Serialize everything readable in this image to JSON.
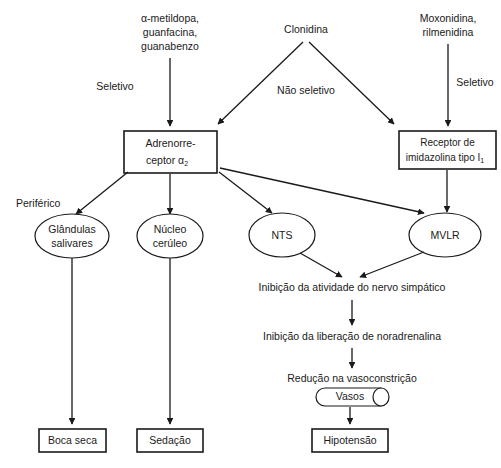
{
  "diagram": {
    "colors": {
      "background": "#ffffff",
      "stroke": "#1a1a1a",
      "text": "#1a1a1a"
    },
    "drug_groups": [
      {
        "id": "alpha-methyldopa-group",
        "lines": [
          "α-metildopa,",
          "guanfacina,",
          "guanabenzo"
        ],
        "pathway_label": "Seletivo"
      },
      {
        "id": "clonidine-group",
        "lines": [
          "Clonidina"
        ],
        "pathway_label": "Não seletivo"
      },
      {
        "id": "moxonidine-group",
        "lines": [
          "Moxonidina,",
          "rilmenidina"
        ],
        "pathway_label": "Seletivo"
      }
    ],
    "receptors": [
      {
        "id": "alpha2-adrenoceptor",
        "line1": "Adrenorre-",
        "line2_main": "ceptor α",
        "line2_sub": "2"
      },
      {
        "id": "imidazoline-receptor",
        "line1": "Receptor de",
        "line2_main": "imidazolina tipo I",
        "line2_sub": "1"
      }
    ],
    "effectors": [
      {
        "id": "salivary-glands",
        "line1": "Glândulas",
        "line2": "salivares"
      },
      {
        "id": "locus-coeruleus",
        "line1": "Núcleo",
        "line2": "cerúleo"
      },
      {
        "id": "nts",
        "line1": "NTS",
        "line2": ""
      },
      {
        "id": "mvlr",
        "line1": "MVLR",
        "line2": ""
      }
    ],
    "side_labels": [
      {
        "id": "peripheral-label",
        "text": "Periférico"
      }
    ],
    "cascade": [
      {
        "id": "sympathetic-inhibition",
        "text": "Inibição da atividade do nervo simpático"
      },
      {
        "id": "noradrenaline-inhibition",
        "text": "Inibição da liberação de noradrenalina"
      },
      {
        "id": "vasoconstriction-reduction",
        "text": "Redução na vasoconstrição"
      }
    ],
    "vessel": {
      "id": "vessel-node",
      "text": "Vasos"
    },
    "outcomes": [
      {
        "id": "dry-mouth",
        "text": "Boca seca"
      },
      {
        "id": "sedation",
        "text": "Sedação"
      },
      {
        "id": "hypotension",
        "text": "Hipotensão"
      }
    ]
  }
}
